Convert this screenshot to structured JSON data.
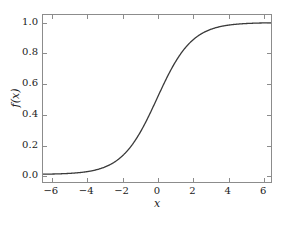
{
  "chart_data": {
    "type": "line",
    "title": "",
    "subtitle": "",
    "xlabel": "x",
    "ylabel": "f(x)",
    "xlim": [
      -6.5,
      6.5
    ],
    "ylim": [
      -0.05,
      1.05
    ],
    "grid": false,
    "legend": null,
    "legend_position": "none",
    "line_color": "#3a3a3a",
    "line_width": 1.3,
    "axis_color": "#8c8c8c",
    "background_color": "#ffffff",
    "xticks": [
      {
        "value": -6,
        "label": "−6"
      },
      {
        "value": -4,
        "label": "−4"
      },
      {
        "value": -2,
        "label": "−2"
      },
      {
        "value": 0,
        "label": "0"
      },
      {
        "value": 2,
        "label": "2"
      },
      {
        "value": 4,
        "label": "4"
      },
      {
        "value": 6,
        "label": "6"
      }
    ],
    "yticks": [
      {
        "value": 0.0,
        "label": "0.0"
      },
      {
        "value": 0.2,
        "label": "0.2"
      },
      {
        "value": 0.4,
        "label": "0.4"
      },
      {
        "value": 0.6,
        "label": "0.6"
      },
      {
        "value": 0.8,
        "label": "0.8"
      },
      {
        "value": 1.0,
        "label": "1.0"
      }
    ],
    "series": [
      {
        "name": "logistic sigmoid",
        "formula": "f(x) = 1 / (1 + e^(-x))",
        "x": [
          -6.5,
          -6.0,
          -5.5,
          -5.0,
          -4.5,
          -4.0,
          -3.5,
          -3.0,
          -2.5,
          -2.0,
          -1.5,
          -1.0,
          -0.5,
          0.0,
          0.5,
          1.0,
          1.5,
          2.0,
          2.5,
          3.0,
          3.5,
          4.0,
          4.5,
          5.0,
          5.5,
          6.0,
          6.5
        ],
        "values": [
          0.0015,
          0.0025,
          0.0041,
          0.0067,
          0.011,
          0.018,
          0.0293,
          0.0474,
          0.0759,
          0.1192,
          0.1824,
          0.2689,
          0.3775,
          0.5,
          0.6225,
          0.7311,
          0.8176,
          0.8808,
          0.9241,
          0.9526,
          0.9707,
          0.982,
          0.989,
          0.9933,
          0.9959,
          0.9975,
          0.9985
        ]
      }
    ]
  }
}
